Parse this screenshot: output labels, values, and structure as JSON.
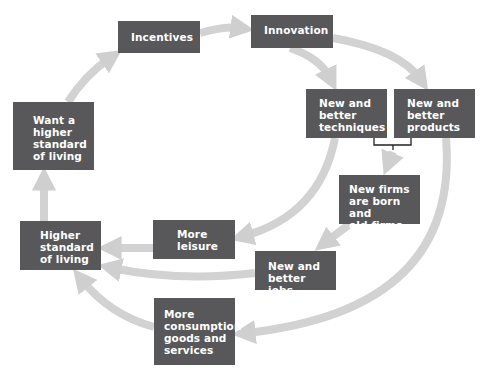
{
  "diagram": {
    "type": "cycle-flow",
    "colors": {
      "box_fill": "#58585a",
      "box_text": "#ffffff",
      "arrow": "#cfcfcf",
      "bracket": "#222222"
    },
    "nodes": [
      {
        "id": "incentives",
        "label": "Incentives"
      },
      {
        "id": "innovation",
        "label": "Innovation"
      },
      {
        "id": "techniques",
        "label": "New and\nbetter\ntechniques"
      },
      {
        "id": "products",
        "label": "New and\nbetter\nproducts"
      },
      {
        "id": "firms",
        "label": "New firms\nare born and\nold firms die"
      },
      {
        "id": "leisure",
        "label": "More\nleisure"
      },
      {
        "id": "jobs",
        "label": "New and\nbetter jobs"
      },
      {
        "id": "higher_sol",
        "label": "Higher\nstandard\nof living"
      },
      {
        "id": "want_sol",
        "label": "Want a\nhigher\nstandard\nof living"
      },
      {
        "id": "consumption",
        "label": "More\nconsumption\ngoods and\nservices"
      }
    ],
    "edges": [
      [
        "incentives",
        "innovation"
      ],
      [
        "innovation",
        "techniques"
      ],
      [
        "innovation",
        "products"
      ],
      [
        "techniques+products",
        "firms"
      ],
      [
        "techniques",
        "leisure"
      ],
      [
        "firms",
        "jobs"
      ],
      [
        "products",
        "consumption"
      ],
      [
        "leisure",
        "higher_sol"
      ],
      [
        "jobs",
        "higher_sol"
      ],
      [
        "consumption",
        "higher_sol"
      ],
      [
        "higher_sol",
        "want_sol"
      ],
      [
        "want_sol",
        "incentives"
      ]
    ]
  }
}
